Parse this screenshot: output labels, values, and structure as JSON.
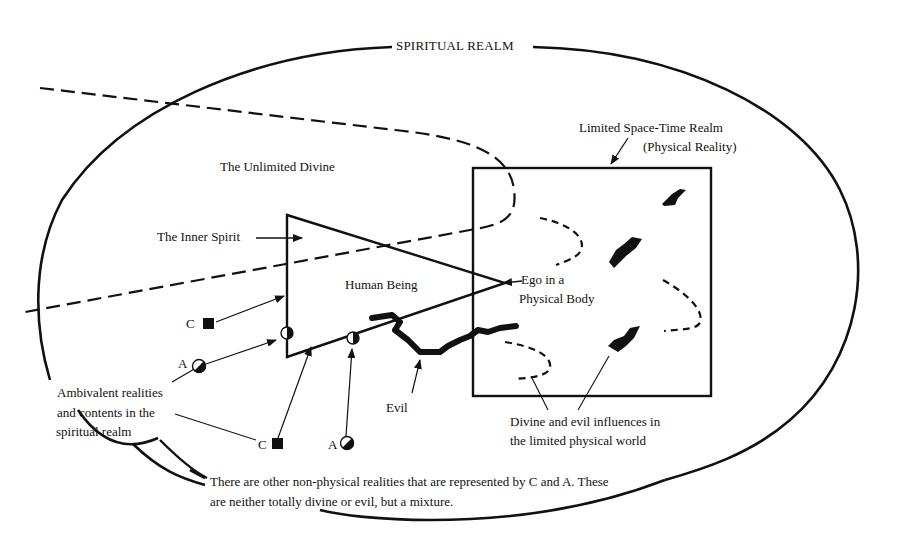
{
  "diagram": {
    "title": "SPIRITUAL REALM",
    "regions": {
      "unlimited_divine": "The Unlimited Divine",
      "space_time_realm": {
        "line1": "Limited Space-Time Realm",
        "line2": "(Physical Reality)"
      }
    },
    "labels": {
      "inner_spirit": "The Inner Spirit",
      "human_being": "Human Being",
      "ego": {
        "line1": "Ego in a",
        "line2": "Physical Body"
      },
      "evil": "Evil",
      "ambivalent": {
        "line1": "Ambivalent realities",
        "line2": "and contents in the",
        "line3": "spiritual realm"
      },
      "influences": {
        "line1": "Divine and evil influences in",
        "line2": "the limited physical world"
      }
    },
    "markers": [
      {
        "letter": "C",
        "shape": "filled-square",
        "position": "upper-left"
      },
      {
        "letter": "A",
        "shape": "half-filled-circle",
        "position": "middle-left"
      },
      {
        "letter": "C",
        "shape": "filled-square",
        "position": "bottom"
      },
      {
        "letter": "A",
        "shape": "half-filled-circle",
        "position": "bottom"
      }
    ],
    "footnote": {
      "line1": "There are other non-physical realities that are represented by C and A. These",
      "line2": "are neither totally divine or evil, but a mixture."
    },
    "colors": {
      "ink": "#111111",
      "background": "#ffffff"
    }
  }
}
